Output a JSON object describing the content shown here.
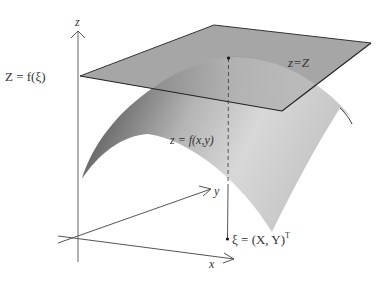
{
  "figure": {
    "axes": {
      "z_label": "z",
      "y_label": "y",
      "x_label": "x"
    },
    "plane": {
      "label": "z=Z",
      "level_label": "Z = f(ξ)"
    },
    "surface": {
      "label": "z = f(x,y)"
    },
    "point": {
      "label": "ξ = (X, Y)",
      "superscript": "T"
    },
    "colors": {
      "plane_fill": "#9a9a9a",
      "plane_edge": "#333333",
      "surface_dark": "#4a4a4a",
      "surface_light": "#e4e4e4",
      "axis": "#555555"
    }
  }
}
